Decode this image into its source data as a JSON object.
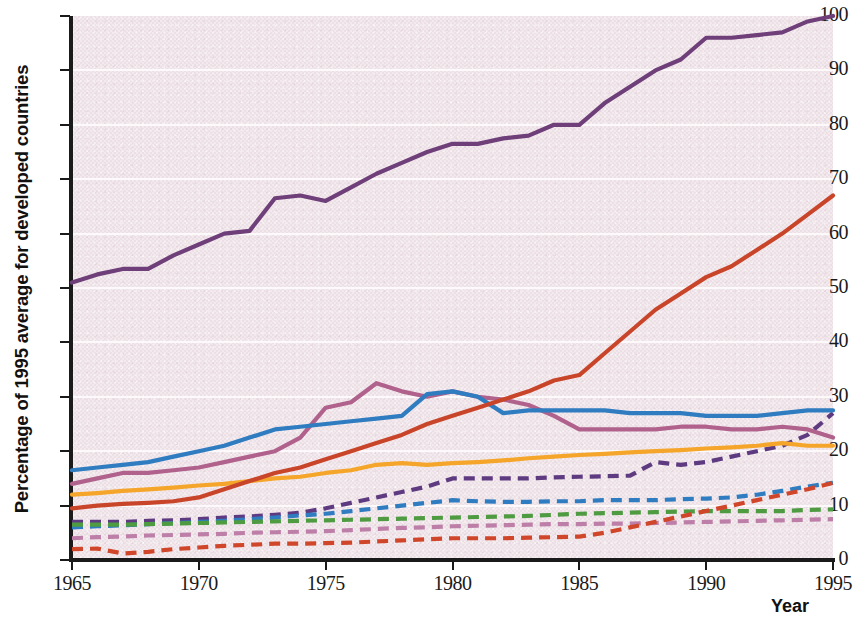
{
  "chart_data": {
    "type": "line",
    "title": "",
    "xlabel": "Year",
    "ylabel": "Percentage of 1995 average for developed countries",
    "xlim": [
      1965,
      1995
    ],
    "ylim": [
      0,
      100
    ],
    "xticks": [
      1965,
      1970,
      1975,
      1980,
      1985,
      1990,
      1995
    ],
    "yticks": [
      0,
      10,
      20,
      30,
      40,
      50,
      60,
      70,
      80,
      90,
      100
    ],
    "grid": "horizontal-white",
    "legend": "none",
    "plot_background": "#f0e6ea",
    "x": [
      1965,
      1966,
      1967,
      1968,
      1969,
      1970,
      1971,
      1972,
      1973,
      1974,
      1975,
      1976,
      1977,
      1978,
      1979,
      1980,
      1981,
      1982,
      1983,
      1984,
      1985,
      1986,
      1987,
      1988,
      1989,
      1990,
      1991,
      1992,
      1993,
      1994,
      1995
    ],
    "series": [
      {
        "name": "series-solid-dark-purple",
        "color": "#6f3f7a",
        "style": "solid",
        "values": [
          51,
          52.5,
          53.5,
          53.5,
          56,
          58,
          60,
          60.5,
          66.5,
          67,
          66,
          68.5,
          71,
          73,
          75,
          76.5,
          76.5,
          77.5,
          78,
          80,
          80,
          84,
          87,
          90,
          92,
          96,
          96,
          96.5,
          97,
          99,
          100
        ]
      },
      {
        "name": "series-solid-red",
        "color": "#c9452a",
        "style": "solid",
        "values": [
          9.5,
          10,
          10.3,
          10.5,
          10.8,
          11.5,
          13,
          14.5,
          16,
          17,
          18.5,
          20,
          21.5,
          23,
          25,
          26.5,
          28,
          29.5,
          31,
          33,
          34,
          38,
          42,
          46,
          49,
          52,
          54,
          57,
          60,
          63.5,
          67
        ]
      },
      {
        "name": "series-solid-blue",
        "color": "#2f7cc0",
        "style": "solid",
        "values": [
          16.5,
          17,
          17.5,
          18,
          19,
          20,
          21,
          22.5,
          24,
          24.5,
          25,
          25.5,
          26,
          26.5,
          30.5,
          31,
          30,
          27,
          27.5,
          27.5,
          27.5,
          27.5,
          27,
          27,
          27,
          26.5,
          26.5,
          26.5,
          27,
          27.5,
          27.5
        ]
      },
      {
        "name": "series-solid-mauve",
        "color": "#b0628d",
        "style": "solid",
        "values": [
          14,
          15,
          16,
          16,
          16.5,
          17,
          18,
          19,
          20,
          22.5,
          28,
          29,
          32.5,
          31,
          30,
          31,
          30,
          29.5,
          28.5,
          26.5,
          24,
          24,
          24,
          24,
          24.5,
          24.5,
          24,
          24,
          24.5,
          24,
          22.5
        ]
      },
      {
        "name": "series-solid-orange",
        "color": "#f4a52a",
        "style": "solid",
        "values": [
          12,
          12.3,
          12.7,
          13,
          13.3,
          13.7,
          14,
          14.5,
          15,
          15.3,
          16,
          16.5,
          17.5,
          17.8,
          17.5,
          17.8,
          18,
          18.3,
          18.7,
          19,
          19.3,
          19.5,
          19.8,
          20,
          20.2,
          20.5,
          20.7,
          21,
          21.5,
          21,
          21
        ]
      },
      {
        "name": "series-dashed-purple",
        "color": "#5e3a80",
        "style": "dashed",
        "values": [
          7,
          7,
          7,
          7.2,
          7.3,
          7.5,
          7.8,
          8,
          8.3,
          8.7,
          9.5,
          10.5,
          11.5,
          12.5,
          13.5,
          15,
          15,
          15,
          15,
          15.2,
          15.3,
          15.4,
          15.5,
          18,
          17.5,
          18,
          19,
          20,
          21,
          23,
          27
        ]
      },
      {
        "name": "series-dashed-blue",
        "color": "#2f7cc0",
        "style": "dashed",
        "values": [
          6,
          6.2,
          6.4,
          6.6,
          6.8,
          7,
          7.2,
          7.5,
          7.8,
          8.2,
          8.5,
          9,
          9.5,
          10,
          10.5,
          11,
          10.8,
          10.7,
          10.7,
          10.8,
          10.8,
          11,
          11,
          11,
          11.2,
          11.3,
          11.5,
          12,
          12.7,
          13.5,
          14.2
        ]
      },
      {
        "name": "series-dashed-green",
        "color": "#4f9b42",
        "style": "dashed",
        "values": [
          6.5,
          6.5,
          6.5,
          6.6,
          6.7,
          6.8,
          6.9,
          7,
          7.1,
          7.2,
          7.3,
          7.4,
          7.5,
          7.6,
          7.7,
          7.8,
          7.9,
          8,
          8.1,
          8.3,
          8.5,
          8.6,
          8.7,
          8.8,
          8.9,
          9,
          9,
          9,
          9,
          9.2,
          9.3
        ]
      },
      {
        "name": "series-dashed-pink",
        "color": "#bd7fa8",
        "style": "dashed",
        "values": [
          4,
          4.2,
          4.3,
          4.5,
          4.6,
          4.7,
          4.8,
          5,
          5.1,
          5.2,
          5.3,
          5.5,
          5.7,
          5.9,
          6,
          6.2,
          6.3,
          6.4,
          6.5,
          6.6,
          6.6,
          6.7,
          6.7,
          6.8,
          6.9,
          7,
          7.1,
          7.2,
          7.3,
          7.4,
          7.5
        ]
      },
      {
        "name": "series-dashed-red",
        "color": "#d0462a",
        "style": "dashed",
        "values": [
          2,
          2.1,
          1.2,
          1.5,
          2,
          2.3,
          2.6,
          2.8,
          3,
          3,
          3.1,
          3.2,
          3.4,
          3.6,
          3.8,
          4,
          4,
          4,
          4.1,
          4.2,
          4.3,
          5,
          6,
          7,
          8,
          9,
          10,
          11,
          12,
          13,
          14.2
        ]
      }
    ]
  },
  "axes": {
    "y_title": "Percentage of 1995 average for developed countries",
    "x_title": "Year",
    "y_tick_labels": [
      "0",
      "10",
      "20",
      "30",
      "40",
      "50",
      "60",
      "70",
      "80",
      "90",
      "100"
    ],
    "x_tick_labels": [
      "1965",
      "1970",
      "1975",
      "1980",
      "1985",
      "1990",
      "1995"
    ]
  }
}
